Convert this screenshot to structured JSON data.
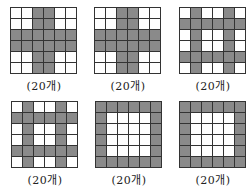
{
  "shaded_color": "#8a8a8a",
  "grid_size": 6,
  "figures": [
    {
      "label": "(20개)",
      "pattern": "plus-center",
      "shaded": [
        [
          0,
          0,
          1,
          1,
          0,
          0
        ],
        [
          0,
          0,
          1,
          1,
          0,
          0
        ],
        [
          1,
          1,
          1,
          1,
          1,
          1
        ],
        [
          1,
          1,
          1,
          1,
          1,
          1
        ],
        [
          0,
          0,
          1,
          1,
          0,
          0
        ],
        [
          0,
          0,
          1,
          1,
          0,
          0
        ]
      ]
    },
    {
      "label": "(20개)",
      "pattern": "plus-center",
      "shaded": [
        [
          0,
          0,
          1,
          1,
          0,
          0
        ],
        [
          0,
          0,
          1,
          1,
          0,
          0
        ],
        [
          1,
          1,
          1,
          1,
          1,
          1
        ],
        [
          1,
          1,
          1,
          1,
          1,
          1
        ],
        [
          0,
          0,
          1,
          1,
          0,
          0
        ],
        [
          0,
          0,
          1,
          1,
          0,
          0
        ]
      ]
    },
    {
      "label": "(20개)",
      "pattern": "hash",
      "shaded": [
        [
          0,
          1,
          0,
          0,
          1,
          0
        ],
        [
          1,
          1,
          1,
          1,
          1,
          1
        ],
        [
          0,
          1,
          0,
          0,
          1,
          0
        ],
        [
          0,
          1,
          0,
          0,
          1,
          0
        ],
        [
          1,
          1,
          1,
          1,
          1,
          1
        ],
        [
          0,
          1,
          0,
          0,
          1,
          0
        ]
      ]
    },
    {
      "label": "(20개)",
      "pattern": "hash",
      "shaded": [
        [
          0,
          1,
          0,
          0,
          1,
          0
        ],
        [
          1,
          1,
          1,
          1,
          1,
          1
        ],
        [
          0,
          1,
          0,
          0,
          1,
          0
        ],
        [
          0,
          1,
          0,
          0,
          1,
          0
        ],
        [
          1,
          1,
          1,
          1,
          1,
          1
        ],
        [
          0,
          1,
          0,
          0,
          1,
          0
        ]
      ]
    },
    {
      "label": "(20개)",
      "pattern": "border",
      "shaded": [
        [
          1,
          1,
          1,
          1,
          1,
          1
        ],
        [
          1,
          0,
          0,
          0,
          0,
          1
        ],
        [
          1,
          0,
          0,
          0,
          0,
          1
        ],
        [
          1,
          0,
          0,
          0,
          0,
          1
        ],
        [
          1,
          0,
          0,
          0,
          0,
          1
        ],
        [
          1,
          1,
          1,
          1,
          1,
          1
        ]
      ]
    },
    {
      "label": "(20개)",
      "pattern": "border",
      "shaded": [
        [
          1,
          1,
          1,
          1,
          1,
          1
        ],
        [
          1,
          0,
          0,
          0,
          0,
          1
        ],
        [
          1,
          0,
          0,
          0,
          0,
          1
        ],
        [
          1,
          0,
          0,
          0,
          0,
          1
        ],
        [
          1,
          0,
          0,
          0,
          0,
          1
        ],
        [
          1,
          1,
          1,
          1,
          1,
          1
        ]
      ]
    }
  ]
}
